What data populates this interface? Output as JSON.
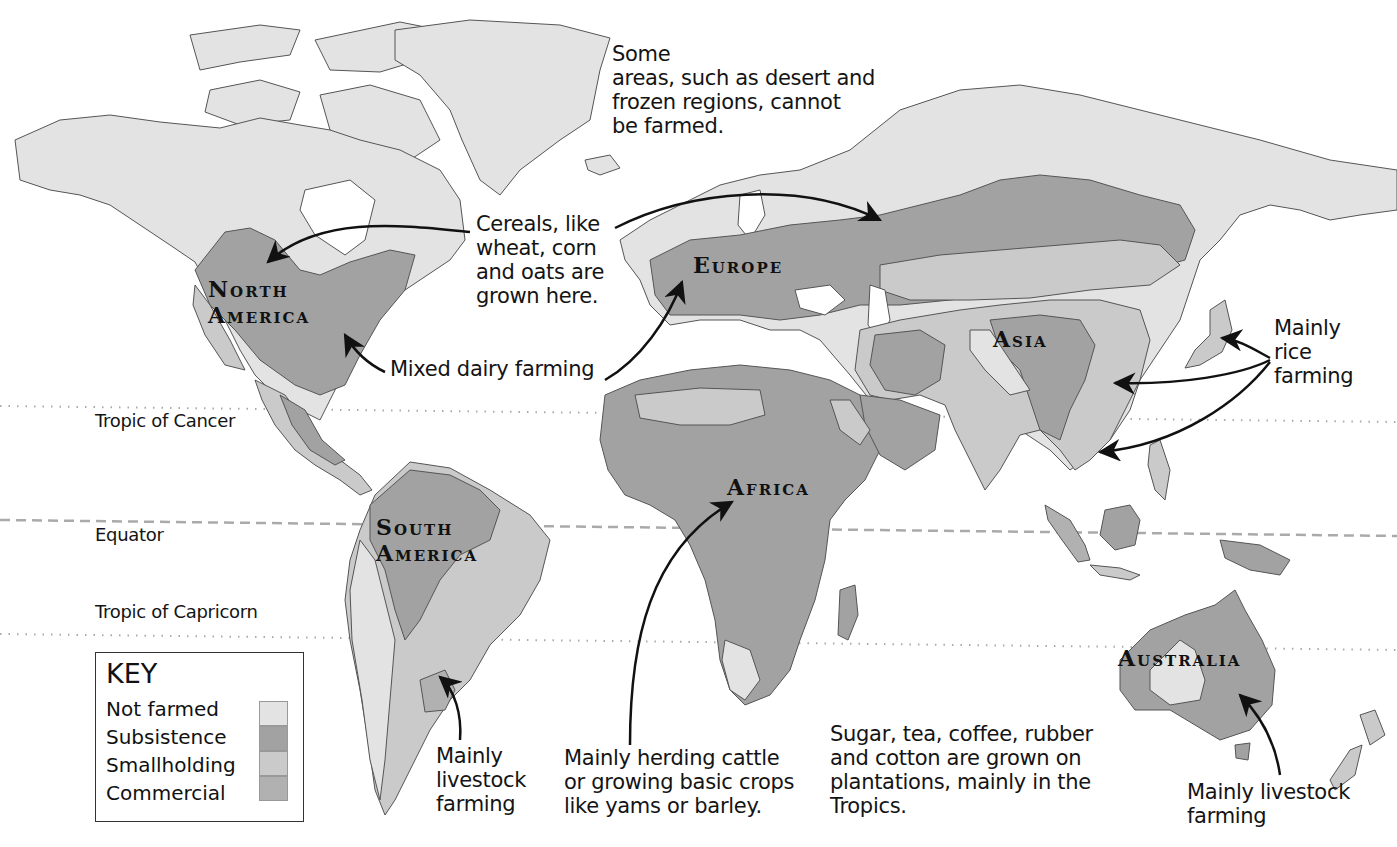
{
  "colors": {
    "ocean": "#ffffff",
    "not_farmed": "#e3e3e3",
    "subsistence": "#a2a2a2",
    "smallholding": "#cacaca",
    "commercial": "#b1b1b1",
    "coastline": "#555555",
    "arrow": "#111111"
  },
  "reference_lines": {
    "tropic_of_cancer": "Tropic of Cancer",
    "equator": "Equator",
    "tropic_of_capricorn": "Tropic of Capricorn"
  },
  "continents": {
    "north_america": [
      "North",
      "America"
    ],
    "south_america": [
      "South",
      "America"
    ],
    "europe": "Europe",
    "africa": "Africa",
    "asia": "Asia",
    "australia": "Australia"
  },
  "annotations": {
    "not_farmed_note": [
      "Some",
      "areas, such as desert and",
      "frozen regions, cannot",
      "be farmed."
    ],
    "cereals": [
      "Cereals, like",
      "wheat, corn",
      "and oats are",
      "grown here."
    ],
    "dairy": "Mixed dairy farming",
    "rice": [
      "Mainly",
      "rice",
      "farming"
    ],
    "sa_livestock": [
      "Mainly",
      "livestock",
      "farming"
    ],
    "africa_herding": [
      "Mainly herding cattle",
      "or growing basic crops",
      "like yams or barley."
    ],
    "plantations": [
      "Sugar, tea, coffee, rubber",
      "and cotton are grown on",
      "plantations, mainly in the",
      "Tropics."
    ],
    "aus_livestock": [
      "Mainly livestock",
      "farming"
    ]
  },
  "key": {
    "title": "KEY",
    "items": [
      {
        "label": "Not farmed",
        "color": "#e3e3e3"
      },
      {
        "label": "Subsistence",
        "color": "#a2a2a2"
      },
      {
        "label": "Smallholding",
        "color": "#cacaca"
      },
      {
        "label": "Commercial",
        "color": "#b1b1b1"
      }
    ]
  }
}
